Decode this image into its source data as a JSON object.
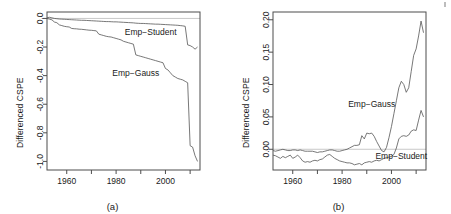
{
  "figure": {
    "background": "#ffffff",
    "line_color": "#555555",
    "axis_color": "#4d4d4d",
    "zero_line_color": "#b0b0b0",
    "width": 451,
    "height": 214
  },
  "panels": [
    {
      "id": "a",
      "caption": "(a)",
      "ylabel": "Differenced CSPE",
      "xlabel": "",
      "ytick_labels": [
        "0.0",
        "-0.2",
        "-0.4",
        "-0.6",
        "-0.8",
        "-1.0"
      ],
      "xtick_labels": [
        "1960",
        "1980",
        "2000"
      ],
      "annotations": [
        {
          "text": "Emp−Student",
          "x": 1994,
          "y": -0.115
        },
        {
          "text": "Emp−Gauss",
          "x": 1988,
          "y": -0.4
        }
      ]
    },
    {
      "id": "b",
      "caption": "(b)",
      "ylabel": "Differenced CSPE",
      "xlabel": "",
      "ytick_labels": [
        "0.00",
        "0.05",
        "0.10",
        "0.15",
        "0.20"
      ],
      "xtick_labels": [
        "1960",
        "1980",
        "2000"
      ],
      "annotations": [
        {
          "text": "Emp−Gauss",
          "x": 1992,
          "y": 0.066
        },
        {
          "text": "Emp−Student",
          "x": 2004,
          "y": -0.0155
        }
      ]
    }
  ],
  "chart_data": [
    {
      "type": "line",
      "panel": "a",
      "title": "(a)",
      "xlabel": "",
      "ylabel": "Differenced CSPE",
      "xlim": [
        1952,
        2014
      ],
      "ylim": [
        -1.06,
        0.045
      ],
      "xticks": [
        1960,
        1980,
        2000
      ],
      "yticks": [
        0.0,
        -0.2,
        -0.4,
        -0.6,
        -0.8,
        -1.0
      ],
      "grid": false,
      "legend": "inline-annotations",
      "zero_reference_line": 0.0,
      "series": [
        {
          "name": "Emp-Student",
          "x": [
            1952,
            1953,
            1954,
            1955,
            1956,
            1957,
            1958,
            1959,
            1960,
            1961,
            1962,
            1963,
            1964,
            1965,
            1966,
            1967,
            1968,
            1969,
            1970,
            1971,
            1972,
            1973,
            1974,
            1975,
            1976,
            1977,
            1978,
            1979,
            1980,
            1981,
            1982,
            1983,
            1984,
            1985,
            1986,
            1987,
            1988,
            1989,
            1990,
            1991,
            1992,
            1993,
            1994,
            1995,
            1996,
            1997,
            1998,
            1999,
            2000,
            2001,
            2002,
            2003,
            2004,
            2005,
            2006,
            2007,
            2008,
            2009,
            2010,
            2011,
            2012,
            2013
          ],
          "values": [
            0.005,
            0.008,
            0.004,
            0.0,
            -0.002,
            -0.004,
            -0.005,
            -0.006,
            -0.007,
            -0.008,
            -0.009,
            -0.01,
            -0.011,
            -0.012,
            -0.013,
            -0.013,
            -0.014,
            -0.015,
            -0.016,
            -0.017,
            -0.018,
            -0.019,
            -0.02,
            -0.021,
            -0.022,
            -0.022,
            -0.023,
            -0.024,
            -0.024,
            -0.025,
            -0.026,
            -0.027,
            -0.028,
            -0.029,
            -0.03,
            -0.031,
            -0.033,
            -0.034,
            -0.035,
            -0.035,
            -0.036,
            -0.037,
            -0.038,
            -0.039,
            -0.04,
            -0.04,
            -0.041,
            -0.042,
            -0.043,
            -0.044,
            -0.045,
            -0.046,
            -0.047,
            -0.048,
            -0.05,
            -0.052,
            -0.055,
            -0.185,
            -0.19,
            -0.2,
            -0.215,
            -0.2
          ]
        },
        {
          "name": "Emp-Gauss",
          "x": [
            1952,
            1953,
            1954,
            1955,
            1956,
            1957,
            1958,
            1959,
            1960,
            1961,
            1962,
            1963,
            1964,
            1965,
            1966,
            1967,
            1968,
            1969,
            1970,
            1971,
            1972,
            1973,
            1974,
            1975,
            1976,
            1977,
            1978,
            1979,
            1980,
            1981,
            1982,
            1983,
            1984,
            1985,
            1986,
            1987,
            1988,
            1989,
            1990,
            1991,
            1992,
            1993,
            1994,
            1995,
            1996,
            1997,
            1998,
            1999,
            2000,
            2001,
            2002,
            2003,
            2004,
            2005,
            2006,
            2007,
            2008,
            2009,
            2010,
            2011,
            2012,
            2013
          ],
          "values": [
            0.0,
            -0.005,
            -0.01,
            -0.025,
            -0.03,
            -0.045,
            -0.05,
            -0.055,
            -0.058,
            -0.06,
            -0.07,
            -0.072,
            -0.073,
            -0.075,
            -0.076,
            -0.078,
            -0.08,
            -0.082,
            -0.083,
            -0.085,
            -0.087,
            -0.11,
            -0.115,
            -0.12,
            -0.125,
            -0.128,
            -0.13,
            -0.135,
            -0.14,
            -0.145,
            -0.15,
            -0.16,
            -0.165,
            -0.17,
            -0.175,
            -0.18,
            -0.255,
            -0.26,
            -0.265,
            -0.27,
            -0.275,
            -0.28,
            -0.285,
            -0.29,
            -0.295,
            -0.3,
            -0.305,
            -0.31,
            -0.35,
            -0.36,
            -0.38,
            -0.4,
            -0.41,
            -0.42,
            -0.425,
            -0.43,
            -0.44,
            -0.45,
            -0.89,
            -0.9,
            -0.96,
            -1.0
          ]
        }
      ]
    },
    {
      "type": "line",
      "panel": "b",
      "title": "(b)",
      "xlabel": "",
      "ylabel": "Differenced CSPE",
      "xlim": [
        1952,
        2014
      ],
      "ylim": [
        -0.032,
        0.212
      ],
      "xticks": [
        1960,
        1980,
        2000
      ],
      "yticks": [
        0.0,
        0.05,
        0.1,
        0.15,
        0.2
      ],
      "grid": false,
      "legend": "inline-annotations",
      "zero_reference_line": 0.0,
      "series": [
        {
          "name": "Emp-Gauss",
          "x": [
            1952,
            1953,
            1954,
            1955,
            1956,
            1957,
            1958,
            1959,
            1960,
            1961,
            1962,
            1963,
            1964,
            1965,
            1966,
            1967,
            1968,
            1969,
            1970,
            1971,
            1972,
            1973,
            1974,
            1975,
            1976,
            1977,
            1978,
            1979,
            1980,
            1981,
            1982,
            1983,
            1984,
            1985,
            1986,
            1987,
            1988,
            1989,
            1990,
            1991,
            1992,
            1993,
            1994,
            1995,
            1996,
            1997,
            1998,
            1999,
            2000,
            2001,
            2002,
            2003,
            2004,
            2005,
            2006,
            2007,
            2008,
            2009,
            2010,
            2011,
            2012,
            2013
          ],
          "values": [
            -0.002,
            -0.003,
            -0.002,
            -0.001,
            0.0,
            -0.001,
            -0.002,
            -0.002,
            -0.001,
            -0.001,
            -0.002,
            -0.001,
            -0.002,
            -0.003,
            -0.003,
            -0.003,
            -0.003,
            -0.004,
            -0.005,
            -0.004,
            -0.004,
            -0.003,
            -0.002,
            -0.001,
            -0.001,
            -0.002,
            -0.003,
            -0.003,
            -0.002,
            -0.001,
            0.0,
            0.002,
            0.004,
            0.006,
            0.006,
            0.007,
            0.021,
            0.016,
            0.025,
            0.024,
            0.025,
            0.02,
            0.012,
            0.005,
            -0.002,
            -0.004,
            0.003,
            0.018,
            0.035,
            0.055,
            0.075,
            0.095,
            0.105,
            0.1,
            0.088,
            0.095,
            0.12,
            0.145,
            0.155,
            0.175,
            0.198,
            0.18
          ]
        },
        {
          "name": "Emp-Student",
          "x": [
            1952,
            1953,
            1954,
            1955,
            1956,
            1957,
            1958,
            1959,
            1960,
            1961,
            1962,
            1963,
            1964,
            1965,
            1966,
            1967,
            1968,
            1969,
            1970,
            1971,
            1972,
            1973,
            1974,
            1975,
            1976,
            1977,
            1978,
            1979,
            1980,
            1981,
            1982,
            1983,
            1984,
            1985,
            1986,
            1987,
            1988,
            1989,
            1990,
            1991,
            1992,
            1993,
            1994,
            1995,
            1996,
            1997,
            1998,
            1999,
            2000,
            2001,
            2002,
            2003,
            2004,
            2005,
            2006,
            2007,
            2008,
            2009,
            2010,
            2011,
            2012,
            2013
          ],
          "values": [
            -0.009,
            -0.01,
            -0.012,
            -0.014,
            -0.011,
            -0.013,
            -0.011,
            -0.009,
            -0.014,
            -0.012,
            -0.009,
            -0.013,
            -0.018,
            -0.02,
            -0.019,
            -0.02,
            -0.018,
            -0.017,
            -0.018,
            -0.016,
            -0.015,
            -0.012,
            -0.009,
            -0.008,
            -0.011,
            -0.014,
            -0.016,
            -0.018,
            -0.019,
            -0.02,
            -0.021,
            -0.021,
            -0.022,
            -0.024,
            -0.023,
            -0.022,
            -0.024,
            -0.021,
            -0.02,
            -0.019,
            -0.02,
            -0.018,
            -0.017,
            -0.018,
            -0.016,
            -0.014,
            -0.013,
            -0.012,
            -0.011,
            -0.008,
            0.002,
            0.016,
            0.02,
            0.021,
            0.02,
            0.022,
            0.028,
            0.03,
            0.029,
            0.045,
            0.06,
            0.05
          ]
        }
      ]
    }
  ]
}
